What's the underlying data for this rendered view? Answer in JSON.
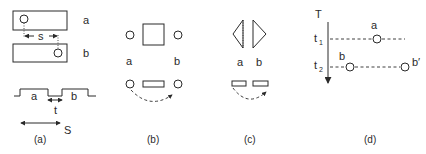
{
  "panels": {
    "a": {
      "caption": "(a)",
      "rect_a_label": "a",
      "rect_b_label": "b",
      "shift_label": "s",
      "pulse_a_label": "a",
      "pulse_b_label": "b",
      "gap_label": "t",
      "span_label": "S"
    },
    "b": {
      "caption": "(b)",
      "label_a": "a",
      "label_b": "b"
    },
    "c": {
      "caption": "(c)",
      "label_a": "a",
      "label_b": "b"
    },
    "d": {
      "caption": "(d)",
      "axis_label": "T",
      "t1_label": "t",
      "t1_sub": "1",
      "t2_label": "t",
      "t2_sub": "2",
      "point_a_label": "a",
      "point_b_label": "b",
      "point_b_prime_label": "b′"
    }
  }
}
